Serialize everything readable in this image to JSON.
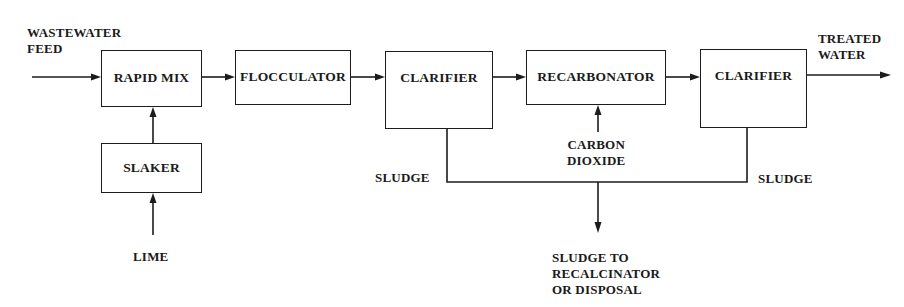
{
  "diagram": {
    "units": {
      "rapid_mix": {
        "label": "RAPID MIX"
      },
      "flocculator": {
        "label": "FLOCCULATOR"
      },
      "clarifier_1": {
        "label": "CLARIFIER"
      },
      "recarbonator": {
        "label": "RECARBONATOR"
      },
      "clarifier_2": {
        "label": "CLARIFIER"
      },
      "slaker": {
        "label": "SLAKER"
      }
    },
    "streams": {
      "feed": {
        "line1": "WASTEWATER",
        "line2": "FEED"
      },
      "treated": {
        "line1": "TREATED",
        "line2": "WATER"
      },
      "lime": {
        "label": "LIME"
      },
      "carbon_dioxide": {
        "line1": "CARBON",
        "line2": "DIOXIDE"
      },
      "sludge_left": {
        "label": "SLUDGE"
      },
      "sludge_right": {
        "label": "SLUDGE"
      },
      "sludge_out": {
        "line1": "SLUDGE TO",
        "line2": "RECALCINATOR",
        "line3": "OR DISPOSAL"
      }
    },
    "connections": [
      {
        "from": "feed",
        "to": "rapid_mix"
      },
      {
        "from": "rapid_mix",
        "to": "flocculator"
      },
      {
        "from": "flocculator",
        "to": "clarifier_1"
      },
      {
        "from": "clarifier_1",
        "to": "recarbonator"
      },
      {
        "from": "recarbonator",
        "to": "clarifier_2"
      },
      {
        "from": "clarifier_2",
        "to": "treated"
      },
      {
        "from": "lime",
        "to": "slaker"
      },
      {
        "from": "slaker",
        "to": "rapid_mix"
      },
      {
        "from": "carbon_dioxide",
        "to": "recarbonator"
      },
      {
        "from": "clarifier_1",
        "to": "sludge_out"
      },
      {
        "from": "clarifier_2",
        "to": "sludge_out"
      }
    ]
  }
}
